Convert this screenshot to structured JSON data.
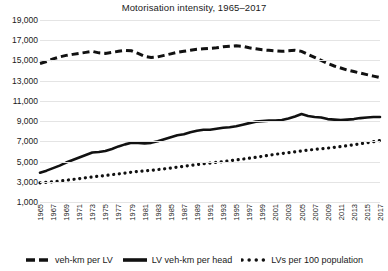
{
  "chart_data": {
    "type": "line",
    "title": "Motorisation intensity, 1965–2017",
    "xlabel": "",
    "ylabel": "",
    "ylim": [
      1000,
      19000
    ],
    "yticks": [
      "1,000",
      "3,000",
      "5,000",
      "7,000",
      "9,000",
      "11,000",
      "13,000",
      "15,000",
      "17,000",
      "19,000"
    ],
    "ytick_values": [
      1000,
      3000,
      5000,
      7000,
      9000,
      11000,
      13000,
      15000,
      17000,
      19000
    ],
    "grid": true,
    "legend_position": "bottom",
    "xlim": [
      1965,
      2017
    ],
    "xtick_labels": [
      "1965",
      "1967",
      "1969",
      "1971",
      "1973",
      "1975",
      "1977",
      "1979",
      "1981",
      "1983",
      "1985",
      "1987",
      "1989",
      "1991",
      "1993",
      "1995",
      "1997",
      "1999",
      "2001",
      "2003",
      "2005",
      "2007",
      "2009",
      "2011",
      "2013",
      "2015",
      "2017"
    ],
    "x": [
      1965,
      1966,
      1967,
      1968,
      1969,
      1970,
      1971,
      1972,
      1973,
      1974,
      1975,
      1976,
      1977,
      1978,
      1979,
      1980,
      1981,
      1982,
      1983,
      1984,
      1985,
      1986,
      1987,
      1988,
      1989,
      1990,
      1991,
      1992,
      1993,
      1994,
      1995,
      1996,
      1997,
      1998,
      1999,
      2000,
      2001,
      2002,
      2003,
      2004,
      2005,
      2006,
      2007,
      2008,
      2009,
      2010,
      2011,
      2012,
      2013,
      2014,
      2015,
      2016,
      2017
    ],
    "series": [
      {
        "name": "veh-km per LV",
        "style": "dashed",
        "color": "#111111",
        "values": [
          14700,
          14900,
          15150,
          15350,
          15500,
          15600,
          15700,
          15800,
          15900,
          15750,
          15700,
          15800,
          15900,
          16000,
          15950,
          15700,
          15400,
          15300,
          15350,
          15500,
          15650,
          15800,
          15900,
          16000,
          16100,
          16150,
          16200,
          16250,
          16350,
          16400,
          16450,
          16400,
          16250,
          16150,
          16050,
          16000,
          15950,
          15900,
          15950,
          16000,
          15900,
          15600,
          15300,
          15000,
          14700,
          14450,
          14250,
          14050,
          13900,
          13750,
          13600,
          13450,
          13300
        ]
      },
      {
        "name": "LV veh-km per head",
        "style": "solid",
        "color": "#111111",
        "values": [
          3900,
          4100,
          4350,
          4600,
          4900,
          5150,
          5400,
          5650,
          5900,
          5950,
          6050,
          6250,
          6500,
          6700,
          6850,
          6850,
          6800,
          6850,
          7000,
          7200,
          7400,
          7600,
          7700,
          7900,
          8050,
          8150,
          8150,
          8250,
          8350,
          8400,
          8500,
          8650,
          8800,
          8950,
          9000,
          9050,
          9050,
          9100,
          9250,
          9450,
          9700,
          9500,
          9400,
          9350,
          9200,
          9150,
          9100,
          9150,
          9200,
          9300,
          9350,
          9400,
          9400
        ]
      },
      {
        "name": "LVs per 100 population",
        "style": "dotted",
        "color": "#111111",
        "values": [
          2900,
          2950,
          3000,
          3070,
          3150,
          3230,
          3310,
          3400,
          3480,
          3550,
          3620,
          3700,
          3780,
          3860,
          3950,
          4020,
          4080,
          4130,
          4200,
          4280,
          4360,
          4450,
          4530,
          4620,
          4700,
          4780,
          4850,
          4920,
          5000,
          5080,
          5160,
          5240,
          5330,
          5420,
          5520,
          5620,
          5720,
          5800,
          5880,
          5960,
          6050,
          6130,
          6200,
          6270,
          6330,
          6400,
          6480,
          6570,
          6660,
          6760,
          6860,
          6960,
          7080
        ]
      }
    ]
  },
  "legend": {
    "items": [
      {
        "label": "veh-km per LV",
        "marker": "dashed-line-marker"
      },
      {
        "label": "LV veh-km per head",
        "marker": "solid-line-marker"
      },
      {
        "label": "LVs per 100 population",
        "marker": "dotted-line-marker"
      }
    ]
  }
}
